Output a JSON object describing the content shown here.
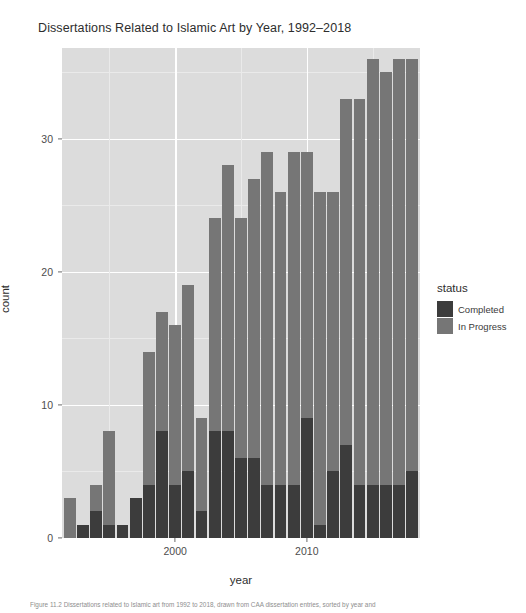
{
  "chart_data": {
    "type": "bar",
    "subtype": "stacked-bar",
    "title": "Dissertations Related to Islamic Art by Year, 1992–2018",
    "xlabel": "year",
    "ylabel": "count",
    "xlim": [
      1991.4,
      2018.6
    ],
    "ylim": [
      0,
      36.8
    ],
    "x_ticks": [
      2000,
      2010
    ],
    "x_tick_labels": [
      "2000",
      "2010"
    ],
    "y_ticks": [
      0,
      10,
      20,
      30
    ],
    "y_tick_labels": [
      "0",
      "10",
      "20",
      "30"
    ],
    "grid": true,
    "grid_color": "#ffffff",
    "panel_background": "#dcdcdc",
    "legend_position": "right",
    "legend_title": "status",
    "categories": [
      "1992",
      "1993",
      "1994",
      "1995",
      "1996",
      "1997",
      "1998",
      "1999",
      "2000",
      "2001",
      "2002",
      "2003",
      "2004",
      "2005",
      "2006",
      "2007",
      "2008",
      "2009",
      "2010",
      "2011",
      "2012",
      "2013",
      "2014",
      "2015",
      "2016",
      "2017",
      "2018"
    ],
    "series": [
      {
        "name": "Completed",
        "color": "#3c3c3c",
        "values": [
          0,
          1,
          2,
          1,
          1,
          3,
          4,
          8,
          4,
          5,
          2,
          8,
          8,
          6,
          6,
          4,
          4,
          4,
          9,
          1,
          5,
          7,
          4,
          4,
          4,
          4,
          5
        ]
      },
      {
        "name": "In Progress",
        "color": "#767676",
        "values": [
          3,
          0,
          2,
          7,
          0,
          0,
          10,
          9,
          12,
          14,
          7,
          16,
          20,
          18,
          21,
          25,
          22,
          25,
          20,
          25,
          21,
          26,
          29,
          32,
          31,
          32,
          31
        ]
      }
    ],
    "totals": [
      3,
      1,
      4,
      8,
      1,
      3,
      14,
      17,
      16,
      19,
      9,
      24,
      28,
      24,
      27,
      25,
      29,
      29,
      29,
      26,
      26,
      33,
      33,
      36,
      35,
      36,
      36
    ],
    "annotations": []
  },
  "legend": {
    "title": "status",
    "entries": [
      {
        "label": "Completed",
        "color": "#3c3c3c"
      },
      {
        "label": "In Progress",
        "color": "#767676"
      }
    ]
  },
  "caption": {
    "text": "Figure 11.2  Dissertations related to Islamic art from 1992 to 2018, drawn from CAA dissertation entries, sorted by year and"
  }
}
